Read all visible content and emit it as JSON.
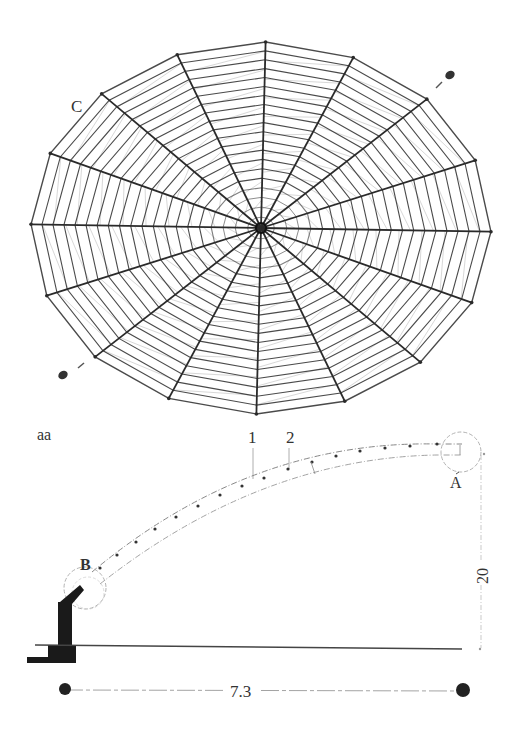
{
  "plan_view": {
    "label_c": "C",
    "center": [
      261,
      228
    ],
    "rx": 230,
    "ry": 186,
    "radial_count": 16,
    "ring_count": 20,
    "stroke_color": "#2a2a2a",
    "light_color": "#8a8a8a"
  },
  "section_view": {
    "label_section": "aa",
    "label_1": "1",
    "label_2": "2",
    "label_a": "A",
    "label_b": "B",
    "dim_span": "7.3",
    "dim_height": "20"
  }
}
